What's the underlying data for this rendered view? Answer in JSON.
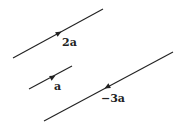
{
  "diagram": {
    "type": "vectors",
    "colors": {
      "line": "#222222",
      "background": "#ffffff"
    },
    "vectors": [
      {
        "name": "2a",
        "label": "2a",
        "line": {
          "x1": 13,
          "y1": 58,
          "x2": 103,
          "y2": 9
        },
        "arrow": {
          "x": 59,
          "y": 33,
          "direction": "up-right"
        },
        "label_pos": {
          "x": 62,
          "y": 46
        }
      },
      {
        "name": "a",
        "label": "a",
        "line": {
          "x1": 29,
          "y1": 89,
          "x2": 72,
          "y2": 66
        },
        "arrow": {
          "x": 53,
          "y": 77,
          "direction": "up-right"
        },
        "label_pos": {
          "x": 54,
          "y": 90
        }
      },
      {
        "name": "-3a",
        "label": "−3a",
        "line": {
          "x1": 44,
          "y1": 121,
          "x2": 173,
          "y2": 52
        },
        "arrow": {
          "x": 107,
          "y": 87,
          "direction": "down-left"
        },
        "label_pos": {
          "x": 101,
          "y": 102
        }
      }
    ]
  }
}
